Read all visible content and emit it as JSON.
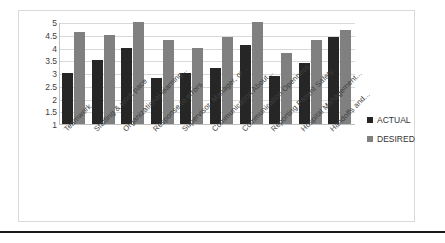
{
  "chart_data": {
    "type": "bar",
    "title": "",
    "subtitle": "",
    "xlabel": "",
    "ylabel": "",
    "ylim": [
      1,
      5
    ],
    "yticks": [
      "5",
      "4.5",
      "4",
      "3.5",
      "3",
      "2.5",
      "2",
      "1.5",
      "1"
    ],
    "grid": true,
    "legend_position": "right",
    "categories": [
      "Teamwork",
      "Staffing & work pace",
      "Organizational learning...",
      "Response to errors",
      "Supervisor, Manager, or ...",
      "Communication About...",
      "Communication Openness",
      "Reporting Patient Safety...",
      "Hospital Management...",
      "Handoffs and..."
    ],
    "series": [
      {
        "name": "ACTUAL",
        "color": "#262626",
        "values": [
          3.0,
          3.5,
          4.0,
          2.8,
          3.0,
          3.2,
          4.1,
          2.9,
          3.4,
          4.4
        ]
      },
      {
        "name": "DESIRED",
        "color": "#808080",
        "values": [
          4.6,
          4.5,
          5.0,
          4.3,
          4.0,
          4.4,
          5.0,
          3.8,
          4.3,
          4.7
        ]
      }
    ]
  },
  "legend": {
    "items": [
      {
        "label": "ACTUAL",
        "color": "#262626"
      },
      {
        "label": "DESIRED",
        "color": "#808080"
      }
    ]
  }
}
